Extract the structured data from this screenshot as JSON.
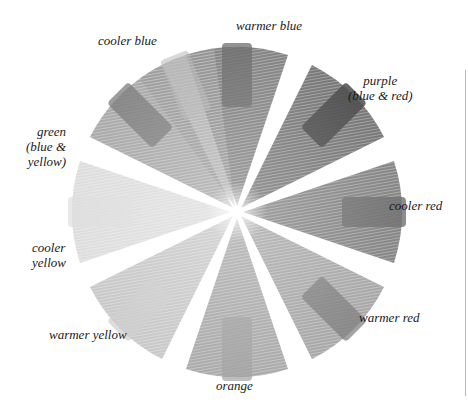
{
  "figure": {
    "title": "",
    "type": "color-wheel-illustration",
    "center": [
      237,
      212
    ],
    "radius": 165,
    "colors": {
      "background": "#ffffff",
      "text": "#1a1a1a",
      "edge_line": "#b8b8b8"
    }
  },
  "segments": [
    {
      "id": "warmer-blue",
      "label_lines": [
        "warmer blue"
      ],
      "angle_deg": -90,
      "pencil_shade": "#5a5a5a",
      "swatch_shade": "#6e6e6e",
      "swatch_opacity": 0.75
    },
    {
      "id": "purple",
      "label_lines": [
        "purple",
        "(blue & red)"
      ],
      "angle_deg": -45,
      "pencil_shade": "#4a4a4a",
      "swatch_shade": "#4c4c4c",
      "swatch_opacity": 0.85
    },
    {
      "id": "cooler-red",
      "label_lines": [
        "cooler red"
      ],
      "angle_deg": 0,
      "pencil_shade": "#5c5c5c",
      "swatch_shade": "#707070",
      "swatch_opacity": 0.8
    },
    {
      "id": "warmer-red",
      "label_lines": [
        "warmer red"
      ],
      "angle_deg": 45,
      "pencil_shade": "#8a8a8a",
      "swatch_shade": "#7a7a7a",
      "swatch_opacity": 0.7
    },
    {
      "id": "orange",
      "label_lines": [
        "orange"
      ],
      "angle_deg": 90,
      "pencil_shade": "#8e8e8e",
      "swatch_shade": "#a2a2a2",
      "swatch_opacity": 0.7
    },
    {
      "id": "warmer-yellow",
      "label_lines": [
        "warmer yellow"
      ],
      "angle_deg": 135,
      "pencil_shade": "#b6b6b6",
      "swatch_shade": "#cfcfcf",
      "swatch_opacity": 0.7
    },
    {
      "id": "cooler-yellow",
      "label_lines": [
        "cooler",
        "yellow"
      ],
      "angle_deg": 180,
      "pencil_shade": "#d2d2d2",
      "swatch_shade": "#dedede",
      "swatch_opacity": 0.7
    },
    {
      "id": "green",
      "label_lines": [
        "green",
        "(blue &",
        "yellow)"
      ],
      "angle_deg": -135,
      "pencil_shade": "#8c8c8c",
      "swatch_shade": "#7c7c7c",
      "swatch_opacity": 0.75
    }
  ],
  "extra_wedge": {
    "id": "cooler-blue",
    "label_lines": [
      "cooler blue"
    ],
    "angle_deg": -112,
    "pencil_shade": "#9a9a9a",
    "swatch_shade": "#b8b8b8",
    "swatch_opacity": 0.55
  },
  "labels": {
    "cooler_blue": [
      "cooler blue"
    ],
    "warmer_blue": [
      "warmer blue"
    ],
    "purple": [
      "purple",
      "(blue & red)"
    ],
    "cooler_red": [
      "cooler red"
    ],
    "warmer_red": [
      "warmer red"
    ],
    "orange": [
      "orange"
    ],
    "warmer_yellow": [
      "warmer yellow"
    ],
    "cooler_yellow": [
      "cooler",
      "yellow"
    ],
    "green": [
      "green",
      "(blue &",
      "yellow)"
    ]
  }
}
